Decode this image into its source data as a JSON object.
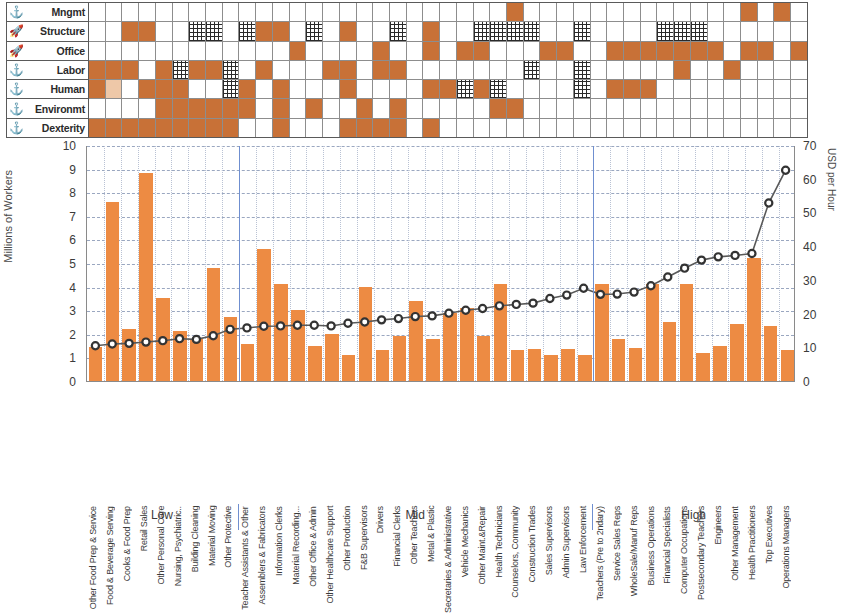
{
  "matrix": {
    "rows": [
      {
        "icon": "anchor-icon",
        "glyph": "⚓",
        "label": "Mngmt"
      },
      {
        "icon": "rocket-icon",
        "glyph": "🚀",
        "label": "Structure"
      },
      {
        "icon": "rocket-icon",
        "glyph": "🚀",
        "label": "Office"
      },
      {
        "icon": "anchor-icon",
        "glyph": "⚓",
        "label": "Labor"
      },
      {
        "icon": "anchor-icon",
        "glyph": "⚓",
        "label": "Human"
      },
      {
        "icon": "anchor-icon",
        "glyph": "⚓",
        "label": "Environmt"
      },
      {
        "icon": "anchor-icon",
        "glyph": "⚓",
        "label": "Dexterity"
      }
    ],
    "legend": {
      "fill": "#c87137",
      "light": "#eec8a8",
      "hatch": "#2a2a2a"
    },
    "cells": [
      [
        0,
        0,
        0,
        0,
        0,
        0,
        0,
        0,
        0,
        0,
        0,
        0,
        0,
        0,
        0,
        0,
        0,
        0,
        0,
        0,
        0,
        0,
        0,
        0,
        0,
        1,
        0,
        0,
        0,
        0,
        0,
        0,
        0,
        0,
        0,
        0,
        0,
        0,
        0,
        1,
        0,
        1,
        0
      ],
      [
        0,
        0,
        1,
        1,
        0,
        0,
        2,
        2,
        0,
        2,
        1,
        1,
        0,
        2,
        0,
        1,
        0,
        0,
        2,
        0,
        1,
        0,
        0,
        2,
        2,
        2,
        2,
        0,
        0,
        2,
        0,
        0,
        0,
        0,
        2,
        2,
        2,
        0,
        0,
        0,
        0,
        0,
        0
      ],
      [
        0,
        0,
        0,
        0,
        0,
        0,
        0,
        0,
        0,
        0,
        0,
        0,
        1,
        0,
        0,
        0,
        0,
        1,
        0,
        0,
        1,
        0,
        1,
        1,
        0,
        0,
        0,
        1,
        1,
        0,
        0,
        1,
        1,
        1,
        1,
        1,
        1,
        1,
        0,
        1,
        1,
        0,
        1
      ],
      [
        1,
        1,
        1,
        0,
        1,
        2,
        1,
        1,
        2,
        0,
        1,
        0,
        0,
        0,
        1,
        1,
        0,
        1,
        1,
        0,
        0,
        0,
        0,
        0,
        0,
        0,
        2,
        0,
        0,
        2,
        0,
        0,
        0,
        0,
        0,
        1,
        0,
        0,
        1,
        0,
        0,
        0,
        0
      ],
      [
        1,
        0,
        0,
        1,
        1,
        1,
        0,
        0,
        2,
        1,
        0,
        1,
        0,
        0,
        0,
        1,
        0,
        0,
        0,
        0,
        1,
        1,
        2,
        1,
        2,
        0,
        0,
        0,
        0,
        2,
        0,
        1,
        1,
        1,
        0,
        0,
        0,
        0,
        0,
        0,
        0,
        0,
        0
      ],
      [
        0,
        0,
        0,
        0,
        1,
        1,
        1,
        1,
        1,
        1,
        0,
        1,
        0,
        1,
        0,
        0,
        1,
        0,
        1,
        0,
        0,
        0,
        0,
        0,
        1,
        1,
        0,
        0,
        0,
        0,
        0,
        0,
        0,
        0,
        0,
        0,
        0,
        0,
        0,
        0,
        0,
        0,
        0
      ],
      [
        1,
        1,
        1,
        1,
        1,
        1,
        1,
        1,
        1,
        0,
        0,
        1,
        0,
        0,
        0,
        1,
        1,
        1,
        1,
        0,
        1,
        0,
        0,
        0,
        0,
        0,
        0,
        0,
        0,
        0,
        0,
        0,
        0,
        0,
        0,
        0,
        0,
        0,
        0,
        0,
        0,
        0,
        0
      ]
    ]
  },
  "chart_data": {
    "type": "bar",
    "title": "",
    "categories": [
      "Other Food Prep & Service",
      "Food & Beverage Serving",
      "Cooks & Food Prep",
      "Retail Sales",
      "Other Personal Care",
      "Nursing, Psychiatric..",
      "Building Cleaning",
      "Material Moving",
      "Other Protective",
      "Teacher Assistants & Other",
      "Assemblers & Fabricators",
      "Information Clerks",
      "Material Recording...",
      "Other Office & Admin",
      "Other Healthcare Support",
      "Other Production",
      "F&B Supervisors",
      "Drivers",
      "Financial Clerks",
      "Other Teachers",
      "Metal & Plastic",
      "Secretaries & Administrative",
      "Vehicle Mechanics",
      "Other Maint.&Repair",
      "Health Technicians",
      "Counselors, Community",
      "Construction Trades",
      "Sales Supervisors",
      "Admin Supervisors",
      "Law Enforcement",
      "Teachers (Pre to 2ndary)",
      "Service Sales Reps",
      "WholeSale/Manuf Reps",
      "Business Operations",
      "Financial Specialists",
      "Computer Occupations",
      "Postsecondary Teachers",
      "Engineers",
      "Other Management",
      "Health Practitioners",
      "Top Executives",
      "Operations Managers"
    ],
    "series": [
      {
        "name": "Millions of Workers",
        "type": "bar",
        "axis": "left",
        "color": "#ed8b43",
        "values": [
          1.45,
          7.6,
          2.2,
          8.8,
          3.5,
          2.1,
          1.8,
          4.8,
          2.7,
          1.55,
          5.6,
          4.1,
          3.0,
          1.5,
          2.0,
          1.1,
          4.0,
          1.3,
          1.9,
          3.4,
          1.8,
          2.9,
          3.1,
          1.9,
          4.1,
          1.3,
          1.35,
          1.1,
          1.35,
          1.1,
          4.1,
          1.8,
          1.4,
          4.1,
          2.5,
          4.1,
          1.2,
          1.5,
          2.4,
          5.2,
          2.35,
          1.3
        ]
      },
      {
        "name": "USD per Hour",
        "type": "line",
        "axis": "right",
        "color": "#595959",
        "marker": "circle",
        "values": [
          10.5,
          11.0,
          11.2,
          11.6,
          12.0,
          12.6,
          12.4,
          13.5,
          15.4,
          15.8,
          16.3,
          16.4,
          16.6,
          16.6,
          16.4,
          17.2,
          17.6,
          18.2,
          18.6,
          19.2,
          19.4,
          20.2,
          21.1,
          21.6,
          22.4,
          22.8,
          23.2,
          24.6,
          25.6,
          27.6,
          25.8,
          25.9,
          26.5,
          28.4,
          31.0,
          33.6,
          36.0,
          37.0,
          37.4,
          38.0,
          53.0,
          62.8
        ]
      }
    ],
    "xlabel": "",
    "ylabel": "Millions of Workers",
    "y2label": "USD per Hour",
    "ylim": [
      0,
      10
    ],
    "y2lim": [
      0,
      70
    ],
    "yticks": [
      0,
      1,
      2,
      3,
      4,
      5,
      6,
      7,
      8,
      9,
      10
    ],
    "y2ticks": [
      0,
      10,
      20,
      30,
      40,
      50,
      60,
      70
    ],
    "grid": true,
    "legend": "none",
    "groups": [
      {
        "label": "Low",
        "start": 0,
        "end": 8
      },
      {
        "label": "Mid",
        "start": 9,
        "end": 29
      },
      {
        "label": "High",
        "start": 30,
        "end": 41
      }
    ]
  }
}
